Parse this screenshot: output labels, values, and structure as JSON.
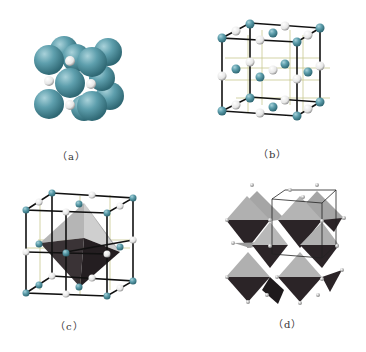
{
  "figure": {
    "panels": [
      {
        "id": "a",
        "label": "（a）",
        "description": "space-filling model"
      },
      {
        "id": "b",
        "label": "（b）",
        "description": "ball-and-stick lattice"
      },
      {
        "id": "c",
        "label": "（c）",
        "description": "lattice with octahedron"
      },
      {
        "id": "d",
        "label": "（d）",
        "description": "octahedra network"
      }
    ],
    "colors": {
      "cation": "#5a9aa8",
      "anion": "#f4f4f4",
      "bond": "#111111",
      "inner_line": "#c8c890",
      "octa_light": "#a8a8a8",
      "octa_dark": "#2a2326"
    }
  }
}
